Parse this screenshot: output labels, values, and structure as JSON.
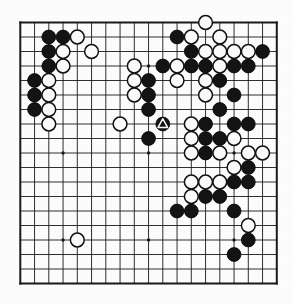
{
  "app": {
    "title": "Go Board Position Diagram",
    "kind": "go-game-board"
  },
  "board": {
    "size": 19,
    "line_color": "#1a1a1a",
    "border_color": "#111111",
    "background_color": "#fdfdfd",
    "black_color": "#141414",
    "white_color": "#fbfbfb",
    "geometry": {
      "left": 20.3,
      "top": 22.5,
      "step_x": 14.25,
      "step_y": 14.5,
      "stone_radius": 6.9,
      "border_width": 2.0,
      "line_width": 0.9
    },
    "star_points": [
      [
        3,
        3
      ],
      [
        9,
        3
      ],
      [
        15,
        3
      ],
      [
        3,
        9
      ],
      [
        9,
        9
      ],
      [
        15,
        9
      ],
      [
        3,
        15
      ],
      [
        9,
        15
      ],
      [
        15,
        15
      ]
    ],
    "stones": [
      {
        "c": 2,
        "r": 1,
        "color": "black"
      },
      {
        "c": 3,
        "r": 1,
        "color": "black"
      },
      {
        "c": 4,
        "r": 1,
        "color": "white"
      },
      {
        "c": 2,
        "r": 2,
        "color": "black"
      },
      {
        "c": 3,
        "r": 2,
        "color": "white"
      },
      {
        "c": 5,
        "r": 2,
        "color": "white"
      },
      {
        "c": 2,
        "r": 3,
        "color": "black"
      },
      {
        "c": 3,
        "r": 3,
        "color": "white"
      },
      {
        "c": 1,
        "r": 4,
        "color": "black"
      },
      {
        "c": 2,
        "r": 4,
        "color": "white"
      },
      {
        "c": 1,
        "r": 5,
        "color": "black"
      },
      {
        "c": 2,
        "r": 5,
        "color": "white"
      },
      {
        "c": 1,
        "r": 6,
        "color": "black"
      },
      {
        "c": 2,
        "r": 6,
        "color": "white"
      },
      {
        "c": 2,
        "r": 7,
        "color": "white"
      },
      {
        "c": 8,
        "r": 3,
        "color": "white"
      },
      {
        "c": 10,
        "r": 3,
        "color": "black"
      },
      {
        "c": 8,
        "r": 4,
        "color": "white"
      },
      {
        "c": 9,
        "r": 4,
        "color": "black"
      },
      {
        "c": 8,
        "r": 5,
        "color": "white"
      },
      {
        "c": 9,
        "r": 5,
        "color": "black"
      },
      {
        "c": 9,
        "r": 6,
        "color": "black"
      },
      {
        "c": 7,
        "r": 7,
        "color": "white"
      },
      {
        "c": 10,
        "r": 7,
        "color": "black",
        "marker": "triangle"
      },
      {
        "c": 9,
        "r": 8,
        "color": "black"
      },
      {
        "c": 13,
        "r": 0,
        "color": "white"
      },
      {
        "c": 11,
        "r": 1,
        "color": "black"
      },
      {
        "c": 12,
        "r": 1,
        "color": "white"
      },
      {
        "c": 14,
        "r": 1,
        "color": "white"
      },
      {
        "c": 12,
        "r": 2,
        "color": "black"
      },
      {
        "c": 13,
        "r": 2,
        "color": "white"
      },
      {
        "c": 14,
        "r": 2,
        "color": "white"
      },
      {
        "c": 15,
        "r": 2,
        "color": "white"
      },
      {
        "c": 16,
        "r": 2,
        "color": "white"
      },
      {
        "c": 17,
        "r": 2,
        "color": "black"
      },
      {
        "c": 11,
        "r": 3,
        "color": "white"
      },
      {
        "c": 12,
        "r": 3,
        "color": "black"
      },
      {
        "c": 13,
        "r": 3,
        "color": "black"
      },
      {
        "c": 14,
        "r": 3,
        "color": "white"
      },
      {
        "c": 15,
        "r": 3,
        "color": "black"
      },
      {
        "c": 16,
        "r": 3,
        "color": "black"
      },
      {
        "c": 11,
        "r": 4,
        "color": "white"
      },
      {
        "c": 13,
        "r": 4,
        "color": "white"
      },
      {
        "c": 14,
        "r": 4,
        "color": "black"
      },
      {
        "c": 13,
        "r": 5,
        "color": "white"
      },
      {
        "c": 15,
        "r": 5,
        "color": "black"
      },
      {
        "c": 14,
        "r": 6,
        "color": "black"
      },
      {
        "c": 12,
        "r": 7,
        "color": "white"
      },
      {
        "c": 13,
        "r": 7,
        "color": "black"
      },
      {
        "c": 15,
        "r": 7,
        "color": "black"
      },
      {
        "c": 16,
        "r": 7,
        "color": "black"
      },
      {
        "c": 12,
        "r": 8,
        "color": "white"
      },
      {
        "c": 13,
        "r": 8,
        "color": "black"
      },
      {
        "c": 14,
        "r": 8,
        "color": "black"
      },
      {
        "c": 15,
        "r": 8,
        "color": "white"
      },
      {
        "c": 12,
        "r": 9,
        "color": "white"
      },
      {
        "c": 13,
        "r": 9,
        "color": "black"
      },
      {
        "c": 14,
        "r": 9,
        "color": "white"
      },
      {
        "c": 16,
        "r": 9,
        "color": "white"
      },
      {
        "c": 17,
        "r": 9,
        "color": "white"
      },
      {
        "c": 15,
        "r": 10,
        "color": "white"
      },
      {
        "c": 16,
        "r": 10,
        "color": "black"
      },
      {
        "c": 12,
        "r": 11,
        "color": "white"
      },
      {
        "c": 13,
        "r": 11,
        "color": "white"
      },
      {
        "c": 14,
        "r": 11,
        "color": "white"
      },
      {
        "c": 15,
        "r": 11,
        "color": "black"
      },
      {
        "c": 16,
        "r": 11,
        "color": "black"
      },
      {
        "c": 12,
        "r": 12,
        "color": "white"
      },
      {
        "c": 13,
        "r": 12,
        "color": "black"
      },
      {
        "c": 14,
        "r": 12,
        "color": "black"
      },
      {
        "c": 11,
        "r": 13,
        "color": "black"
      },
      {
        "c": 12,
        "r": 13,
        "color": "black"
      },
      {
        "c": 15,
        "r": 13,
        "color": "black"
      },
      {
        "c": 16,
        "r": 14,
        "color": "white"
      },
      {
        "c": 16,
        "r": 15,
        "color": "black"
      },
      {
        "c": 15,
        "r": 16,
        "color": "black"
      },
      {
        "c": 4,
        "r": 15,
        "color": "white"
      }
    ],
    "marker": {
      "type": "triangle",
      "stone_column": 10,
      "stone_row": 7,
      "stone_color": "black",
      "outline_color": "#ffffff"
    },
    "counts": {
      "black_stones": 42,
      "white_stones": 38,
      "total_stones": 80
    }
  }
}
